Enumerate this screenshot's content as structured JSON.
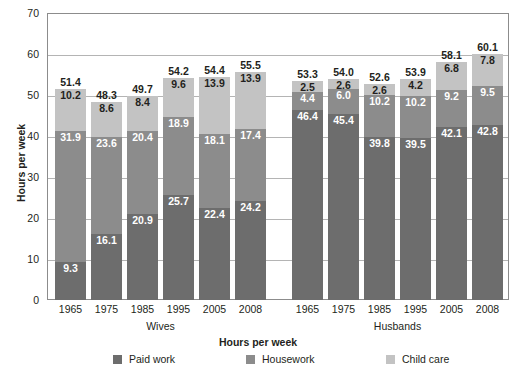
{
  "chart_data": {
    "type": "bar",
    "subtype": "stacked-bar-grouped",
    "title": "Hours per week",
    "xlabel": "",
    "ylabel": "Hours per week",
    "ylim": [
      0,
      70
    ],
    "yticks": [
      0,
      10,
      20,
      30,
      40,
      50,
      60,
      70
    ],
    "ytick_labels": [
      "0",
      "10",
      "20",
      "30",
      "40",
      "50",
      "60",
      "70"
    ],
    "grid": true,
    "legend_position": "bottom",
    "legend": [
      "Paid work",
      "Housework",
      "Child care"
    ],
    "series": [
      {
        "name": "Paid work",
        "color": "#6d6d6d"
      },
      {
        "name": "Housework",
        "color": "#8c8c8c"
      },
      {
        "name": "Child care",
        "color": "#c3c3c3"
      }
    ],
    "groups": [
      {
        "name": "Wives",
        "categories": [
          "1965",
          "1975",
          "1985",
          "1995",
          "2005",
          "2008"
        ],
        "values": {
          "Paid work": [
            9.3,
            16.1,
            20.9,
            25.7,
            22.4,
            24.2
          ],
          "Housework": [
            31.9,
            23.6,
            20.4,
            18.9,
            18.1,
            17.4
          ],
          "Child care": [
            10.2,
            8.6,
            8.4,
            9.6,
            13.9,
            13.9
          ]
        },
        "totals": [
          51.4,
          48.3,
          49.7,
          54.2,
          54.4,
          55.5
        ]
      },
      {
        "name": "Husbands",
        "categories": [
          "1965",
          "1975",
          "1985",
          "1995",
          "2005",
          "2008"
        ],
        "values": {
          "Paid work": [
            46.4,
            45.4,
            39.8,
            39.5,
            42.1,
            42.8
          ],
          "Housework": [
            4.4,
            6.0,
            10.2,
            10.2,
            9.2,
            9.5
          ],
          "Child care": [
            2.5,
            2.6,
            2.6,
            4.2,
            6.8,
            7.8
          ]
        },
        "totals": [
          53.3,
          54.0,
          52.6,
          53.9,
          58.1,
          60.1
        ]
      }
    ]
  },
  "axis": {
    "y_title": "Hours per week",
    "y_tick_labels": [
      "0",
      "10",
      "20",
      "30",
      "40",
      "50",
      "60",
      "70"
    ]
  },
  "group_labels": {
    "wives": "Wives",
    "husbands": "Husbands"
  },
  "title": "Hours per week",
  "legend": {
    "paid_work": "Paid work",
    "housework": "Housework",
    "child_care": "Child care"
  },
  "colors": {
    "paid_work": "#6d6d6d",
    "housework": "#8c8c8c",
    "child_care": "#c3c3c3",
    "frame": "#8c8c8c",
    "grid": "#b4b4b4",
    "text": "#231f20"
  }
}
